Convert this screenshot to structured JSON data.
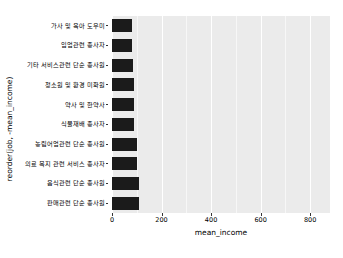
{
  "chart_data": {
    "type": "bar",
    "orientation": "horizontal",
    "title": "",
    "xlabel": "mean_income",
    "ylabel": "reorder(job, -mean_income)",
    "xlim": [
      0,
      880
    ],
    "ylim": null,
    "grid": true,
    "legend": null,
    "bar_color": "#1b1b1b",
    "panel_color": "#ebebeb",
    "gridline_color": "#ffffff",
    "xticks": [
      0,
      200,
      400,
      600,
      800
    ],
    "xtick_labels": [
      "0",
      "200",
      "400",
      "600",
      "800"
    ],
    "xticks_minor": [
      100,
      300,
      500,
      700
    ],
    "categories": [
      "가사 및 육아 도우미",
      "임업관련 종사자",
      "기타 서비스관련 단순 종사원",
      "청소원 및 환경 미화원",
      "약사 및 한약사",
      "식물재배 종사자",
      "농림어업관련 단순 종사원",
      "의료 복지 관련 서비스 종사자",
      "음식관련 단순 종사원",
      "판매관련 단순 종사원"
    ],
    "values": [
      80,
      82,
      85,
      87,
      88,
      90,
      100,
      102,
      107,
      110
    ]
  }
}
